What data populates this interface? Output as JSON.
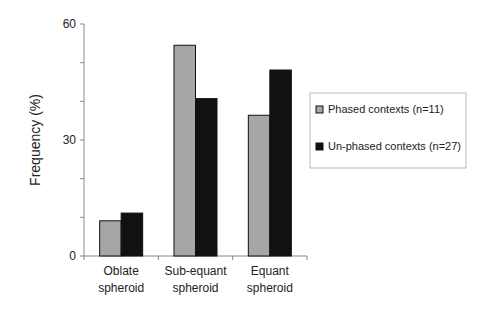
{
  "chart_data": {
    "type": "bar",
    "title": "",
    "xlabel": "",
    "ylabel": "Frequency (%)",
    "ylim": [
      0,
      60
    ],
    "yticks_major": [
      0,
      30,
      60
    ],
    "yticks_minor_step": 10,
    "grid": false,
    "legend_position": "right",
    "categories": [
      [
        "Oblate",
        "spheroid"
      ],
      [
        "Sub-equant",
        "spheroid"
      ],
      [
        "Equant",
        "spheroid"
      ]
    ],
    "series": [
      {
        "name": "Phased contexts (n=11)",
        "color": "#a6a6a6",
        "values": [
          9.1,
          54.5,
          36.4
        ]
      },
      {
        "name": "Un-phased contexts (n=27)",
        "color": "#111111",
        "values": [
          11.1,
          40.7,
          48.1
        ]
      }
    ]
  }
}
